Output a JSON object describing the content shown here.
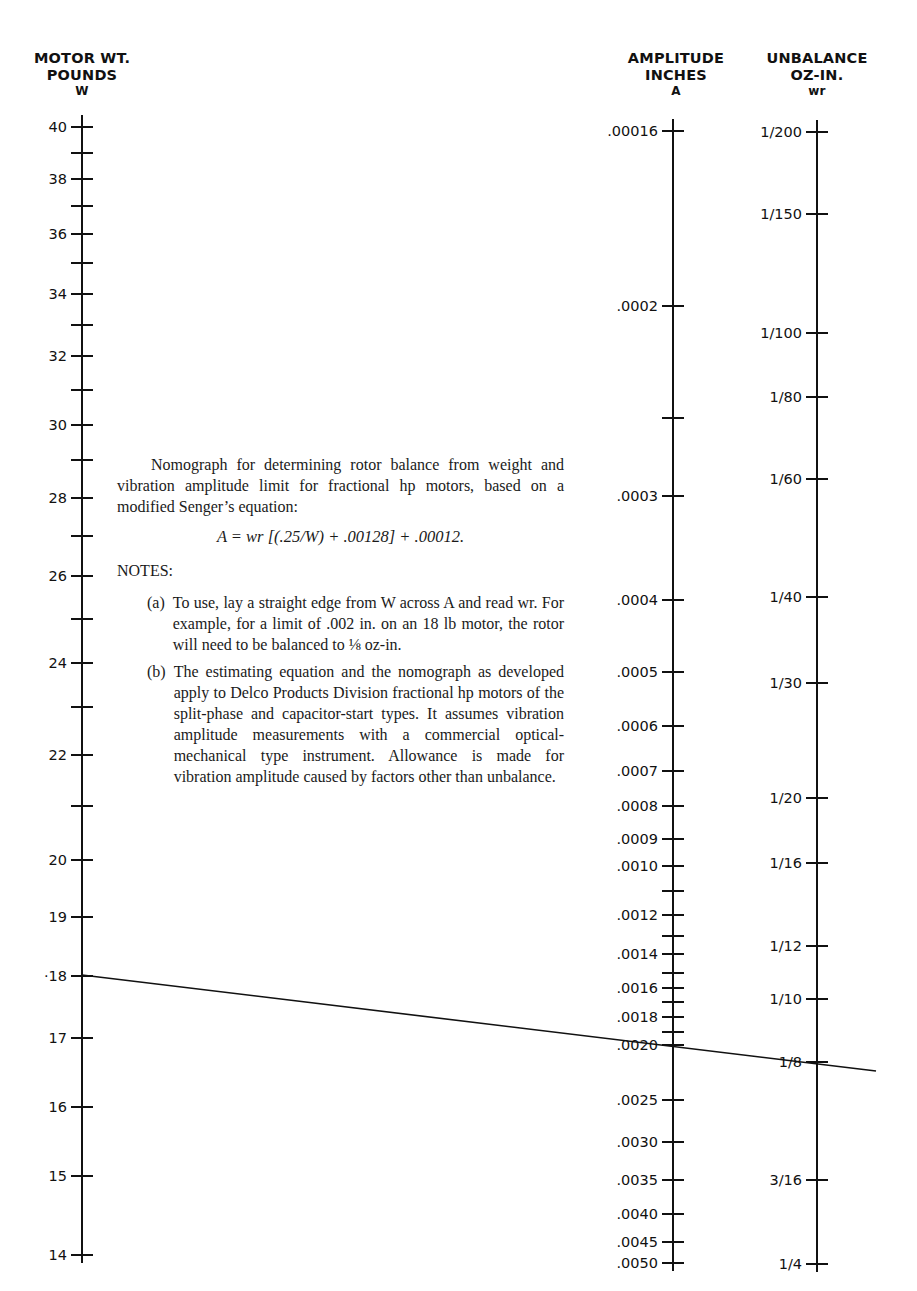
{
  "scales": {
    "weight": {
      "title_line1": "MOTOR WT.",
      "title_line2": "POUNDS",
      "symbol": "W",
      "axis_x": 82,
      "ticks": [
        {
          "label": "40",
          "y": 127
        },
        {
          "label": "",
          "y": 153
        },
        {
          "label": "38",
          "y": 179
        },
        {
          "label": "",
          "y": 206
        },
        {
          "label": "36",
          "y": 234
        },
        {
          "label": "",
          "y": 263
        },
        {
          "label": "34",
          "y": 294
        },
        {
          "label": "",
          "y": 325
        },
        {
          "label": "32",
          "y": 356
        },
        {
          "label": "",
          "y": 390
        },
        {
          "label": "30",
          "y": 425
        },
        {
          "label": "",
          "y": 460
        },
        {
          "label": "28",
          "y": 498
        },
        {
          "label": "",
          "y": 536
        },
        {
          "label": "26",
          "y": 576
        },
        {
          "label": "",
          "y": 619
        },
        {
          "label": "24",
          "y": 663
        },
        {
          "label": "",
          "y": 707
        },
        {
          "label": "22",
          "y": 755
        },
        {
          "label": "",
          "y": 806
        },
        {
          "label": "20",
          "y": 860
        },
        {
          "label": "19",
          "y": 917
        },
        {
          "label": "·18",
          "y": 976
        },
        {
          "label": "17",
          "y": 1038
        },
        {
          "label": "16",
          "y": 1107
        },
        {
          "label": "15",
          "y": 1176
        },
        {
          "label": "14",
          "y": 1255
        }
      ]
    },
    "amplitude": {
      "title_line1": "AMPLITUDE",
      "title_line2": "INCHES",
      "symbol": "A",
      "axis_x": 673,
      "ticks": [
        {
          "label": ".00016",
          "y": 131
        },
        {
          "label": ".0002",
          "y": 306
        },
        {
          "label": "",
          "y": 418
        },
        {
          "label": ".0003",
          "y": 496
        },
        {
          "label": ".0004",
          "y": 600
        },
        {
          "label": ".0005",
          "y": 672
        },
        {
          "label": ".0006",
          "y": 726
        },
        {
          "label": ".0007",
          "y": 771
        },
        {
          "label": ".0008",
          "y": 806
        },
        {
          "label": ".0009",
          "y": 839
        },
        {
          "label": ".0010",
          "y": 866
        },
        {
          "label": "",
          "y": 891
        },
        {
          "label": ".0012",
          "y": 915
        },
        {
          "label": "",
          "y": 936
        },
        {
          "label": ".0014",
          "y": 954
        },
        {
          "label": "",
          "y": 973
        },
        {
          "label": ".0016",
          "y": 988
        },
        {
          "label": "",
          "y": 1002
        },
        {
          "label": ".0018",
          "y": 1017
        },
        {
          "label": "",
          "y": 1032
        },
        {
          "label": ".0020",
          "y": 1045
        },
        {
          "label": ".0025",
          "y": 1100
        },
        {
          "label": ".0030",
          "y": 1142
        },
        {
          "label": ".0035",
          "y": 1180
        },
        {
          "label": ".0040",
          "y": 1214
        },
        {
          "label": ".0045",
          "y": 1242
        },
        {
          "label": ".0050",
          "y": 1263
        }
      ]
    },
    "unbalance": {
      "title_line1": "UNBALANCE",
      "title_line2": "OZ-IN.",
      "symbol": "wr",
      "axis_x": 817,
      "ticks": [
        {
          "label": "1/200",
          "y": 132
        },
        {
          "label": "1/150",
          "y": 214
        },
        {
          "label": "1/100",
          "y": 333
        },
        {
          "label": "1/80",
          "y": 397
        },
        {
          "label": "1/60",
          "y": 479
        },
        {
          "label": "1/40",
          "y": 597
        },
        {
          "label": "1/30",
          "y": 683
        },
        {
          "label": "1/20",
          "y": 798
        },
        {
          "label": "1/16",
          "y": 863
        },
        {
          "label": "1/12",
          "y": 946
        },
        {
          "label": "1/10",
          "y": 999
        },
        {
          "label": "1/8",
          "y": 1062
        },
        {
          "label": "3/16",
          "y": 1180
        },
        {
          "label": "1/4",
          "y": 1264
        }
      ]
    }
  },
  "example_line": {
    "x1": 82,
    "y1": 975,
    "x2": 876,
    "y2": 1071,
    "W": "18",
    "A": ".0020",
    "wr": "1/8"
  },
  "caption": {
    "intro": "Nomograph for determining rotor balance from weight and vibration amplitude limit for fractional hp motors, based on a modified Senger’s equation:",
    "equation": "A = wr [(.25/W) + .00128] + .00012.",
    "notes_heading": "NOTES:",
    "notes": [
      {
        "mark": "(a)",
        "text": "To use, lay a straight edge from W across A and read wr. For example, for a limit of .002 in. on an 18 lb motor, the rotor will need to be balanced to ⅛ oz-in."
      },
      {
        "mark": "(b)",
        "text": "The estimating equation and the nomograph as developed apply to Delco Products Division fractional hp motors of the split-phase and capacitor-start types. It assumes vibration amplitude measurements with a commercial optical-mechanical type instrument. Allowance is made for vibration amplitude caused by factors other than unbalance."
      }
    ]
  }
}
